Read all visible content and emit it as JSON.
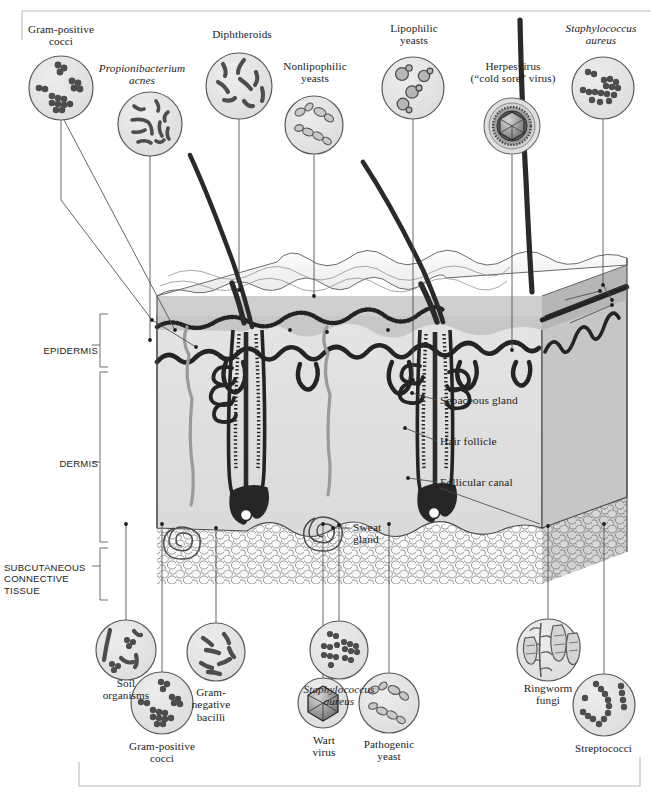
{
  "layer_labels": [
    {
      "id": "epidermis",
      "text": "EPIDERMIS",
      "x": 6,
      "y": 345,
      "w": 92,
      "align": "right"
    },
    {
      "id": "dermis",
      "text": "DERMIS",
      "x": 6,
      "y": 458,
      "w": 92,
      "align": "right"
    },
    {
      "id": "subcutaneous",
      "text": "SUBCUTANEOUS\nCONNECTIVE\nTISSUE",
      "x": 4,
      "y": 562,
      "w": 96,
      "align": "left"
    }
  ],
  "inner_labels": [
    {
      "id": "sebaceous-gland",
      "text": "Sebaceous gland",
      "x": 440,
      "y": 399
    },
    {
      "id": "hair-follicle",
      "text": "Hair follicle",
      "x": 440,
      "y": 440
    },
    {
      "id": "follicular-canal",
      "text": "Follicular canal",
      "x": 440,
      "y": 481
    },
    {
      "id": "sweat-gland",
      "text": "Sweat\ngland",
      "x": 353,
      "y": 525
    }
  ],
  "top_callouts": [
    {
      "id": "gram-positive-cocci-top",
      "label": "Gram-positive\ncocci",
      "italic": false,
      "label_x": 10,
      "label_y": 23,
      "label_w": 102,
      "circle": {
        "cx": 61,
        "cy": 88,
        "r": 32
      },
      "content": "cocci-clusters"
    },
    {
      "id": "propionibacterium-acnes",
      "label": "Propionibacterium\nacnes",
      "italic": true,
      "label_x": 84,
      "label_y": 62,
      "label_w": 116,
      "circle": {
        "cx": 150,
        "cy": 124,
        "r": 32
      },
      "content": "rods-curved"
    },
    {
      "id": "diphtheroids",
      "label": "Diphtheroids",
      "italic": false,
      "label_x": 190,
      "label_y": 28,
      "label_w": 104,
      "circle": {
        "cx": 239,
        "cy": 86,
        "r": 33
      },
      "content": "rods-club"
    },
    {
      "id": "nonlipophilic-yeasts",
      "label": "Nonlipophilic\nyeasts",
      "italic": false,
      "label_x": 267,
      "label_y": 60,
      "label_w": 96,
      "circle": {
        "cx": 314,
        "cy": 125,
        "r": 29
      },
      "content": "yeast-chains"
    },
    {
      "id": "lipophilic-yeasts",
      "label": "Lipophilic\nyeasts",
      "italic": false,
      "label_x": 366,
      "label_y": 22,
      "label_w": 96,
      "circle": {
        "cx": 413,
        "cy": 88,
        "r": 31
      },
      "content": "yeast-budding"
    },
    {
      "id": "herpesvirus",
      "label": "Herpesvirus\n(“cold sore” virus)",
      "italic": false,
      "label_x": 455,
      "label_y": 60,
      "label_w": 116,
      "circle": {
        "cx": 512,
        "cy": 126,
        "r": 28
      },
      "content": "herpes-enveloped-icosahedron"
    },
    {
      "id": "staphylococcus-aureus-top",
      "label": "Staphylococcus\naureus",
      "italic": true,
      "label_x": 551,
      "label_y": 22,
      "label_w": 100,
      "circle": {
        "cx": 603,
        "cy": 88,
        "r": 31
      },
      "content": "cocci-grapes"
    }
  ],
  "bottom_callouts": [
    {
      "id": "soil-organisms",
      "label": "Soil\norganisms",
      "italic": false,
      "label_x": 80,
      "label_y": 677,
      "label_w": 92,
      "circle": {
        "cx": 126,
        "cy": 650,
        "r": 30
      },
      "content": "soil-mixed"
    },
    {
      "id": "gram-positive-cocci-bottom",
      "label": "Gram-positive\ncocci",
      "italic": false,
      "label_x": 110,
      "label_y": 732,
      "label_w": 104,
      "circle": {
        "cx": 162,
        "cy": 703,
        "r": 31
      },
      "content": "cocci-clusters"
    },
    {
      "id": "gram-negative-bacilli",
      "label": "Gram-\nnegative\nbacilli",
      "italic": false,
      "label_x": 172,
      "label_y": 690,
      "label_w": 78,
      "circle": {
        "cx": 216,
        "cy": 652,
        "r": 29
      },
      "content": "bacilli"
    },
    {
      "id": "staphylococcus-aureus-bottom",
      "label": "Staphylococcus\naureus",
      "italic": true,
      "label_x": 287,
      "label_y": 683,
      "label_w": 104,
      "circle": {
        "cx": 339,
        "cy": 650,
        "r": 29
      },
      "content": "cocci-grapes"
    },
    {
      "id": "wart-virus",
      "label": "Wart\nvirus",
      "italic": false,
      "label_x": 287,
      "label_y": 730,
      "label_w": 72,
      "circle": {
        "cx": 323,
        "cy": 703,
        "r": 25
      },
      "content": "icosahedron"
    },
    {
      "id": "pathogenic-yeast",
      "label": "Pathogenic\nyeast",
      "italic": false,
      "label_x": 343,
      "label_y": 730,
      "label_w": 92,
      "circle": {
        "cx": 389,
        "cy": 703,
        "r": 30
      },
      "content": "yeast-chains"
    },
    {
      "id": "ringworm-fungi",
      "label": "Ringworm\nfungi",
      "italic": false,
      "label_x": 502,
      "label_y": 682,
      "label_w": 92,
      "circle": {
        "cx": 548,
        "cy": 650,
        "r": 31
      },
      "content": "ringworm-hyphae"
    },
    {
      "id": "streptococci",
      "label": "Streptococci",
      "italic": false,
      "label_x": 556,
      "label_y": 738,
      "label_w": 95,
      "circle": {
        "cx": 604,
        "cy": 705,
        "r": 31
      },
      "content": "strep-chains"
    }
  ],
  "colors": {
    "stroke": "#262626",
    "skin_surface": "#f1f1f1",
    "skin_top": "#e9e9e9",
    "epidermis_band": "#c9c9c9",
    "dermis": "#dedede",
    "dermis_side": "#c2c2c2",
    "subcutaneous": "#fbfbfb",
    "inset_fill": "#e3e3e3",
    "microbe_dark": "#4a4a4a",
    "microbe_mid": "#8d8d8d",
    "frame": "#b8b8b8"
  }
}
